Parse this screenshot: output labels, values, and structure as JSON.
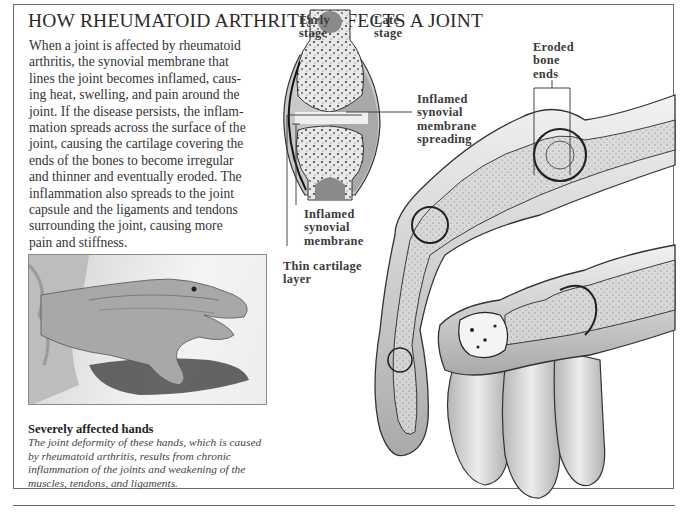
{
  "title": "HOW RHEUMATOID ARTHRITIS AFFECTS A JOINT",
  "body_lines": [
    "When a joint is affected by rheumatoid",
    "arthritis, the synovial membrane that",
    "lines the joint becomes inflamed, caus-",
    "ing heat, swelling, and pain around the",
    "joint. If the disease persists, the inflam-",
    "mation spreads across the surface of the",
    "joint, causing the cartilage covering the",
    "ends of the bones to become irregular",
    "and thinner and eventually eroded. The",
    "inflammation also spreads to the joint",
    "capsule and the ligaments and tendons",
    "surrounding the joint, causing more",
    "pain and stiffness."
  ],
  "joint_diagram": {
    "labels": {
      "early_stage": [
        "Early",
        "stage"
      ],
      "late_stage": [
        "Late",
        "stage"
      ],
      "inflamed_spreading": [
        "Inflamed",
        "synovial",
        "membrane",
        "spreading"
      ],
      "inflamed_membrane": [
        "Inflamed",
        "synovial",
        "membrane"
      ],
      "thin_cartilage": [
        "Thin cartilage",
        "layer"
      ]
    }
  },
  "hand_illustration": {
    "labels": {
      "eroded_bone_ends": [
        "Eroded",
        "bone",
        "ends"
      ]
    }
  },
  "photo": {
    "alt": "Photograph of a hand severely affected by rheumatoid arthritis"
  },
  "caption": {
    "title": "Severely affected hands",
    "lines": [
      "The joint deformity of these hands, which is caused",
      "by rheumatoid arthritis, results from chronic",
      "inflammation of the joints and weakening of the",
      "muscles, tendons, and ligaments."
    ]
  },
  "colors": {
    "frame": "#6a6a6a",
    "text": "#333333",
    "illustration_shade": "#bdbdbd"
  }
}
